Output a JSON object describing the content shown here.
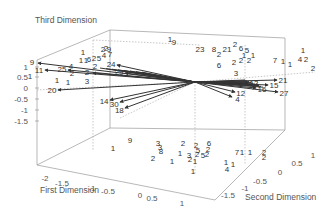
{
  "chart_data": {
    "type": "scatter",
    "subtype": "3d-biplot",
    "axes": {
      "x": {
        "label": "First Dimension",
        "ticks": [
          "-2",
          "-1.5",
          "-1",
          "-0.5",
          "0",
          "0.5",
          "1"
        ]
      },
      "y": {
        "label": "Second Dimension",
        "ticks": [
          "-1.5",
          "-1",
          "-0.5",
          "0",
          "0.5",
          "1"
        ]
      },
      "z": {
        "label": "Third Dimension",
        "ticks": [
          "1",
          "0.5",
          "0",
          "-0.5",
          "-1",
          "-1.5"
        ]
      }
    },
    "grid": false,
    "legend": null,
    "box": {
      "back_top_left": [
        110,
        30
      ],
      "back_top_right": [
        285,
        38
      ],
      "front_top_left": [
        37,
        60
      ],
      "back_bottom_right": [
        285,
        130
      ],
      "front_bottom_left": [
        37,
        165
      ],
      "front_bottom_right": [
        215,
        200
      ],
      "inner_top": [
        110,
        30
      ],
      "inner_vertical_x": 93,
      "inner_back_vertical_x": 285
    },
    "origin_px": [
      195,
      82
    ],
    "vectors": [
      {
        "label": "11",
        "end": [
          45,
          70
        ]
      },
      {
        "label": "9",
        "end": [
          38,
          63
        ]
      },
      {
        "label": "25",
        "end": [
          68,
          70
        ]
      },
      {
        "label": "2",
        "end": [
          93,
          73
        ]
      },
      {
        "label": "24",
        "end": [
          117,
          65
        ]
      },
      {
        "label": "29",
        "end": [
          125,
          73
        ]
      },
      {
        "label": "20",
        "end": [
          58,
          90
        ]
      },
      {
        "label": "14",
        "end": [
          110,
          100
        ]
      },
      {
        "label": "30",
        "end": [
          120,
          102
        ]
      },
      {
        "label": "18",
        "end": [
          125,
          108
        ]
      },
      {
        "label": "13",
        "end": [
          248,
          83
        ]
      },
      {
        "label": "16",
        "end": [
          256,
          88
        ]
      },
      {
        "label": "15",
        "end": [
          268,
          85
        ]
      },
      {
        "label": "21",
        "end": [
          277,
          80
        ]
      },
      {
        "label": "27",
        "end": [
          278,
          92
        ]
      },
      {
        "label": "12",
        "end": [
          235,
          92
        ]
      },
      {
        "label": "4",
        "end": [
          232,
          97
        ]
      }
    ],
    "points": [
      {
        "label": "1",
        "px": [
          30,
          79
        ]
      },
      {
        "label": "1",
        "px": [
          57,
          83
        ]
      },
      {
        "label": "1",
        "px": [
          68,
          85
        ]
      },
      {
        "label": "4",
        "px": [
          71,
          69
        ]
      },
      {
        "label": "2",
        "px": [
          72,
          76
        ]
      },
      {
        "label": "3",
        "px": [
          87,
          84
        ]
      },
      {
        "label": "1",
        "px": [
          83,
          55
        ]
      },
      {
        "label": "1",
        "px": [
          81,
          63
        ]
      },
      {
        "label": "1",
        "px": [
          86,
          63
        ]
      },
      {
        "label": "6",
        "px": [
          89,
          62
        ]
      },
      {
        "label": "2",
        "px": [
          94,
          61
        ]
      },
      {
        "label": "5",
        "px": [
          99,
          61
        ]
      },
      {
        "label": "2",
        "px": [
          95,
          69
        ]
      },
      {
        "label": "2",
        "px": [
          103,
          52
        ]
      },
      {
        "label": "2",
        "px": [
          106,
          51
        ]
      },
      {
        "label": "9",
        "px": [
          109,
          52
        ]
      },
      {
        "label": "4",
        "px": [
          104,
          58
        ]
      },
      {
        "label": "7",
        "px": [
          110,
          57
        ]
      },
      {
        "label": "1",
        "px": [
          170,
          42
        ]
      },
      {
        "label": "9",
        "px": [
          174,
          45
        ]
      },
      {
        "label": "23",
        "px": [
          200,
          52
        ]
      },
      {
        "label": "8",
        "px": [
          214,
          52
        ]
      },
      {
        "label": "2",
        "px": [
          219,
          57
        ]
      },
      {
        "label": "2",
        "px": [
          234,
          65
        ]
      },
      {
        "label": "21",
        "px": [
          227,
          52
        ]
      },
      {
        "label": "6",
        "px": [
          219,
          68
        ]
      },
      {
        "label": "2",
        "px": [
          235,
          47
        ]
      },
      {
        "label": "6",
        "px": [
          241,
          51
        ]
      },
      {
        "label": "5",
        "px": [
          247,
          53
        ]
      },
      {
        "label": "1",
        "px": [
          244,
          58
        ]
      },
      {
        "label": "1",
        "px": [
          253,
          58
        ]
      },
      {
        "label": "2",
        "px": [
          241,
          63
        ]
      },
      {
        "label": "2",
        "px": [
          249,
          63
        ]
      },
      {
        "label": "3",
        "px": [
          236,
          76
        ]
      },
      {
        "label": "7",
        "px": [
          275,
          63
        ]
      },
      {
        "label": "1",
        "px": [
          283,
          64
        ]
      },
      {
        "label": "1",
        "px": [
          290,
          67
        ]
      },
      {
        "label": "1",
        "px": [
          303,
          53
        ]
      },
      {
        "label": "4",
        "px": [
          300,
          62
        ]
      },
      {
        "label": "2",
        "px": [
          306,
          62
        ]
      },
      {
        "label": "2",
        "px": [
          313,
          71
        ]
      },
      {
        "label": "1",
        "px": [
          113,
          151
        ]
      },
      {
        "label": "9",
        "px": [
          130,
          143
        ]
      },
      {
        "label": "3",
        "px": [
          158,
          146
        ]
      },
      {
        "label": "3",
        "px": [
          160,
          150
        ]
      },
      {
        "label": "8",
        "px": [
          161,
          154
        ]
      },
      {
        "label": "2",
        "px": [
          153,
          161
        ]
      },
      {
        "label": "1",
        "px": [
          172,
          164
        ]
      },
      {
        "label": "1",
        "px": [
          180,
          156
        ]
      },
      {
        "label": "2",
        "px": [
          183,
          146
        ]
      },
      {
        "label": "3",
        "px": [
          189,
          158
        ]
      },
      {
        "label": "2",
        "px": [
          190,
          162
        ]
      },
      {
        "label": "1",
        "px": [
          195,
          164
        ]
      },
      {
        "label": "2",
        "px": [
          196,
          148
        ]
      },
      {
        "label": "5",
        "px": [
          198,
          153
        ]
      },
      {
        "label": "2",
        "px": [
          197,
          157
        ]
      },
      {
        "label": "5",
        "px": [
          203,
          158
        ]
      },
      {
        "label": "6",
        "px": [
          209,
          146
        ]
      },
      {
        "label": "2",
        "px": [
          208,
          152
        ]
      },
      {
        "label": "2",
        "px": [
          207,
          157
        ]
      },
      {
        "label": "1",
        "px": [
          193,
          174
        ]
      },
      {
        "label": "1",
        "px": [
          226,
          165
        ]
      },
      {
        "label": "1",
        "px": [
          233,
          167
        ]
      },
      {
        "label": "4",
        "px": [
          227,
          172
        ]
      },
      {
        "label": "7",
        "px": [
          237,
          155
        ]
      },
      {
        "label": "1",
        "px": [
          242,
          155
        ]
      },
      {
        "label": "1",
        "px": [
          250,
          155
        ]
      },
      {
        "label": "2",
        "px": [
          264,
          155
        ]
      },
      {
        "label": "2",
        "px": [
          264,
          160
        ]
      }
    ],
    "tick_positions": {
      "x": [
        [
          45,
          181
        ],
        [
          62,
          186
        ],
        [
          92,
          191
        ],
        [
          108,
          194
        ],
        [
          140,
          198
        ],
        [
          152,
          201
        ],
        [
          182,
          206
        ]
      ],
      "y": [
        [
          228,
          198
        ],
        [
          245,
          191
        ],
        [
          260,
          184
        ],
        [
          280,
          175
        ],
        [
          297,
          166
        ],
        [
          313,
          158
        ]
      ],
      "z": [
        [
          28,
          70
        ],
        [
          28,
          80
        ],
        [
          28,
          91
        ],
        [
          28,
          102
        ],
        [
          28,
          113
        ],
        [
          28,
          124
        ]
      ]
    },
    "title_positions": {
      "x": [
        40,
        193
      ],
      "y": [
        245,
        200
      ],
      "z": [
        35,
        23
      ]
    }
  }
}
